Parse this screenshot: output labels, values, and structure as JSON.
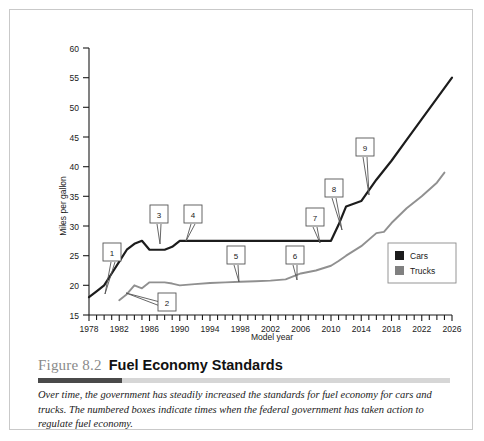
{
  "figure": {
    "number": "Figure 8.2",
    "title": "Fuel Economy Standards",
    "caption": "Over time, the government has steadily increased the standards for fuel economy for cars and trucks. The numbered boxes indicate times when the federal government has taken action to regulate fuel economy."
  },
  "legend": {
    "cars_label": "Cars",
    "trucks_label": "Trucks"
  },
  "callouts": [
    {
      "id": "1",
      "label": "1"
    },
    {
      "id": "2",
      "label": "2"
    },
    {
      "id": "3",
      "label": "3"
    },
    {
      "id": "4",
      "label": "4"
    },
    {
      "id": "5",
      "label": "5"
    },
    {
      "id": "6",
      "label": "6"
    },
    {
      "id": "7",
      "label": "7"
    },
    {
      "id": "8",
      "label": "8"
    },
    {
      "id": "9",
      "label": "9"
    }
  ],
  "y_tick_labels": [
    "60",
    "55",
    "50",
    "45",
    "40",
    "35",
    "30",
    "25",
    "20",
    "15"
  ],
  "x_tick_labels": [
    "1978",
    "1982",
    "1986",
    "1990",
    "1994",
    "1998",
    "2002",
    "2006",
    "2010",
    "2014",
    "2018",
    "2022",
    "2026"
  ],
  "chart_data": {
    "type": "line",
    "title": "Fuel Economy Standards",
    "xlabel": "Model year",
    "ylabel": "Miles per gallon",
    "xlim": [
      1978,
      2026
    ],
    "ylim": [
      15,
      60
    ],
    "ytick_step": 5,
    "xtick_step": 1,
    "xtick_label_step": 4,
    "grid": false,
    "legend_position": "right-middle",
    "colors": {
      "cars": "#1c1c1c",
      "trucks": "#909090"
    },
    "series": [
      {
        "name": "Cars",
        "color": "#1c1c1c",
        "x": [
          1978,
          1979,
          1980,
          1981,
          1982,
          1983,
          1984,
          1985,
          1986,
          1987,
          1988,
          1989,
          1990,
          1991,
          1995,
          2000,
          2005,
          2008,
          2010,
          2011,
          2012,
          2014,
          2016,
          2018,
          2020,
          2022,
          2024,
          2026
        ],
        "values": [
          18.0,
          19.0,
          20.0,
          22.0,
          24.0,
          26.0,
          27.0,
          27.5,
          26.0,
          26.0,
          26.0,
          26.5,
          27.5,
          27.5,
          27.5,
          27.5,
          27.5,
          27.5,
          27.5,
          30.2,
          33.3,
          34.2,
          37.8,
          41.0,
          44.5,
          48.0,
          51.5,
          55.0
        ]
      },
      {
        "name": "Trucks",
        "color": "#909090",
        "x": [
          1982,
          1983,
          1984,
          1985,
          1986,
          1987,
          1988,
          1989,
          1990,
          1992,
          1994,
          1996,
          1998,
          2000,
          2002,
          2004,
          2005,
          2006,
          2008,
          2010,
          2011,
          2012,
          2014,
          2016,
          2017,
          2018,
          2020,
          2022,
          2024,
          2025
        ],
        "values": [
          17.5,
          18.5,
          20.0,
          19.5,
          20.5,
          20.5,
          20.5,
          20.3,
          20.0,
          20.2,
          20.4,
          20.5,
          20.6,
          20.7,
          20.8,
          21.0,
          21.5,
          22.0,
          22.5,
          23.3,
          24.1,
          25.0,
          26.6,
          28.8,
          29.0,
          30.5,
          33.0,
          35.0,
          37.3,
          39.0
        ]
      }
    ],
    "annotations": [
      {
        "label": "1",
        "series": "Cars",
        "x": 1978,
        "y": 18.0,
        "note": "points to start of cars standard"
      },
      {
        "label": "2",
        "series": "Trucks",
        "x": 1982,
        "y": 17.5,
        "note": "points to start of trucks standard"
      },
      {
        "label": "3",
        "series": "Cars",
        "x": 1986,
        "y": 26.0,
        "note": "points to dip in cars standard"
      },
      {
        "label": "4",
        "series": "Cars",
        "x": 1990,
        "y": 27.5,
        "note": "points to return to 27.5 mpg"
      },
      {
        "label": "5",
        "series": "Trucks",
        "x": 1997,
        "y": 20.5,
        "note": "points to flat trucks standard"
      },
      {
        "label": "6",
        "series": "Trucks",
        "x": 2004,
        "y": 21.0,
        "note": "points to trucks standard increase"
      },
      {
        "label": "7",
        "series": "Cars",
        "x": 2008,
        "y": 27.5,
        "note": "points to end of long 27.5 plateau"
      },
      {
        "label": "8",
        "series": "Cars",
        "x": 2011,
        "y": 30.2,
        "note": "points to sharp rise in cars standard"
      },
      {
        "label": "9",
        "series": "Cars",
        "x": 2015,
        "y": 36.0,
        "note": "points to continued rise in cars standard"
      }
    ]
  }
}
